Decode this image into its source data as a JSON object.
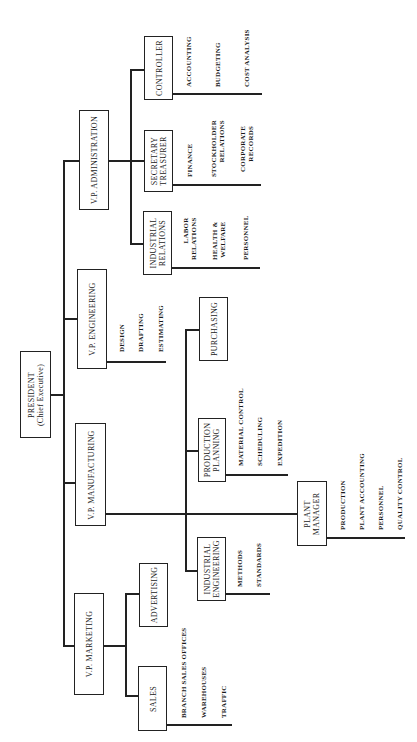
{
  "president": {
    "line1": "PRESIDENT",
    "line2": "(Chief Executive)"
  },
  "vp_administration": {
    "title": "V.P. ADMINISTRATION",
    "controller": {
      "title": "CONTROLLER",
      "items": [
        "ACCOUNTING",
        "BUDGETING",
        "COST ANALYSIS"
      ]
    },
    "secretary_treasurer": {
      "line1": "SECRETARY",
      "line2": "TREASURER",
      "items": [
        "FINANCE",
        "STOCKHOLDER RELATIONS",
        "CORPORATE RECORDS"
      ]
    },
    "industrial_relations": {
      "line1": "INDUSTRIAL",
      "line2": "RELATIONS",
      "items": [
        "LABOR RELATIONS",
        "HEALTH & WELFARE",
        "PERSONNEL"
      ]
    }
  },
  "vp_engineering": {
    "title": "V.P. ENGINEERING",
    "items": [
      "DESIGN",
      "DRAFTING",
      "ESTIMATING"
    ]
  },
  "vp_manufacturing": {
    "title": "V.P. MANUFACTURING",
    "purchasing": {
      "title": "PURCHASING"
    },
    "production_planning": {
      "line1": "PRODUCTION",
      "line2": "PLANNING",
      "items": [
        "MATERIAL CONTROL",
        "SCHEDULING",
        "EXPEDITION"
      ]
    },
    "industrial_engineering": {
      "line1": "INDUSTRIAL",
      "line2": "ENGINEERING",
      "items": [
        "METHODS",
        "STANDARDS"
      ]
    },
    "plant_manager": {
      "line1": "PLANT",
      "line2": "MANAGER",
      "items": [
        "PRODUCTION",
        "PLANT ACCOUNTING",
        "PERSONNEL",
        "QUALITY CONTROL"
      ]
    }
  },
  "vp_marketing": {
    "title": "V.P. MARKETING",
    "advertising": {
      "title": "ADVERTISING"
    },
    "sales": {
      "title": "SALES",
      "items": [
        "BRANCH SALES OFFICES",
        "WAREHOUSES",
        "TRAFFIC"
      ]
    }
  },
  "stockholder_split": [
    "STOCKHOLDER",
    "RELATIONS"
  ],
  "corporate_split": [
    "CORPORATE",
    "RECORDS"
  ],
  "labor_split": [
    "LABOR",
    "RELATIONS"
  ],
  "health_split": [
    "HEALTH &",
    "WELFARE"
  ]
}
